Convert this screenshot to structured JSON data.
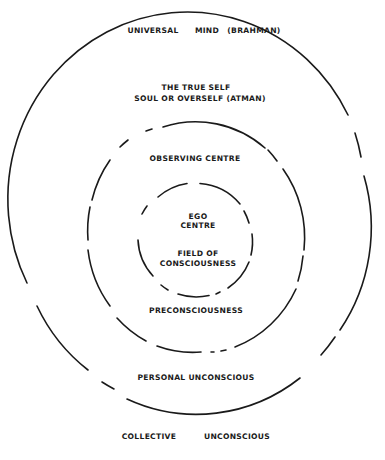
{
  "diagram": {
    "colors": {
      "ink": "#1a1a1a",
      "background": "#ffffff"
    },
    "labels": {
      "universal_mind": {
        "word1": "UNIVERSAL",
        "word2": "MIND",
        "word3": "(BRAHMAN)"
      },
      "true_self": {
        "line1": "THE TRUE SELF",
        "line2": "SOUL OR OVERSELF (ATMAN)"
      },
      "observing_centre": "OBSERVING CENTRE",
      "ego_centre": {
        "line1": "EGO",
        "line2": "CENTRE"
      },
      "field_of_consciousness": {
        "line1": "FIELD OF",
        "line2": "CONSCIOUSNESS"
      },
      "preconsciousness": "PRECONSCIOUSNESS",
      "personal_unconscious": "PERSONAL UNCONSCIOUS",
      "collective_unconscious": {
        "word1": "COLLECTIVE",
        "word2": "UNCONSCIOUS"
      }
    },
    "rings": [
      {
        "name": "outer",
        "cx": 195.5,
        "cy": 236,
        "rx": 171,
        "ry": 178,
        "style": "mostly-solid with gaps"
      },
      {
        "name": "middle",
        "cx": 196,
        "cy": 237.5,
        "rx": 109,
        "ry": 114.5,
        "style": "dashed"
      },
      {
        "name": "inner",
        "cx": 195.5,
        "cy": 240,
        "rx": 57.5,
        "ry": 57,
        "style": "dashed"
      }
    ]
  }
}
